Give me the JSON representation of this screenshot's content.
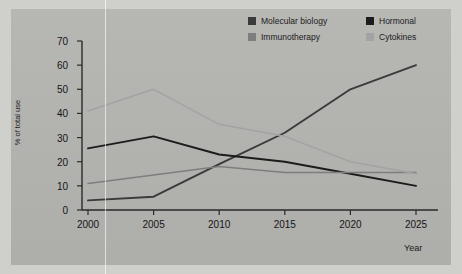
{
  "chart_data": {
    "type": "line",
    "title": "",
    "xlabel": "Year",
    "ylabel": "% of total use",
    "categories": [
      2000,
      2005,
      2010,
      2015,
      2020,
      2025
    ],
    "x": [
      2000,
      2005,
      2010,
      2015,
      2020,
      2025
    ],
    "xlim": [
      2000,
      2025
    ],
    "ylim": [
      0,
      70
    ],
    "yticks": [
      0,
      10,
      20,
      30,
      40,
      50,
      60,
      70
    ],
    "xticks": [
      "2000",
      "2005",
      "2010",
      "2015",
      "2020",
      "2025"
    ],
    "grid": false,
    "legend_position": "top-right",
    "series": [
      {
        "name": "Molecular biology",
        "color": "#3a3a3a",
        "values": [
          4,
          5.5,
          19,
          32,
          50,
          60
        ]
      },
      {
        "name": "Hormonal",
        "color": "#1c1c1c",
        "values": [
          25.5,
          30.5,
          23,
          20,
          15,
          10
        ]
      },
      {
        "name": "Immunotherapy",
        "color": "#7e7e7e",
        "values": [
          11,
          14.5,
          18,
          15.5,
          15.5,
          15.5
        ]
      },
      {
        "name": "Cytokines",
        "color": "#a3a3a3",
        "values": [
          41,
          50,
          35.5,
          30.5,
          20,
          15
        ]
      }
    ]
  },
  "axes": {
    "y_title": "% of total use",
    "x_title": "Year"
  },
  "legend": {
    "items": [
      {
        "label": "Molecular biology",
        "color": "#3a3a3a"
      },
      {
        "label": "Hormonal",
        "color": "#1c1c1c"
      },
      {
        "label": "Immunotherapy",
        "color": "#7e7e7e"
      },
      {
        "label": "Cytokines",
        "color": "#a3a3a3"
      }
    ]
  },
  "colors": {
    "panel_background": "#b4b4b1",
    "page_background": "#cfcfcc",
    "axis": "#2a2a2a",
    "text": "#151515"
  }
}
